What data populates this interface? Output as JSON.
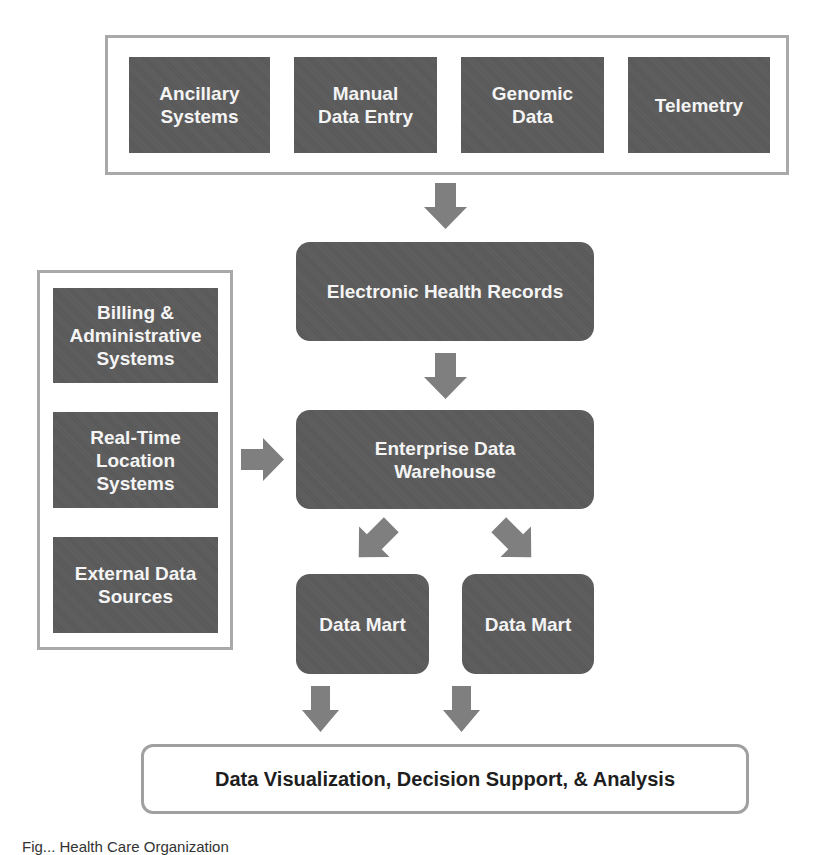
{
  "diagram": {
    "sources_top": [
      {
        "label": "Ancillary\nSystems"
      },
      {
        "label": "Manual\nData Entry"
      },
      {
        "label": "Genomic\nData"
      },
      {
        "label": "Telemetry"
      }
    ],
    "sources_left": [
      {
        "label": "Billing &\nAdministrative\nSystems"
      },
      {
        "label": "Real-Time\nLocation\nSystems"
      },
      {
        "label": "External Data\nSources"
      }
    ],
    "ehr": {
      "label": "Electronic Health Records"
    },
    "edw": {
      "label": "Enterprise Data\nWarehouse"
    },
    "data_marts": [
      {
        "label": "Data Mart"
      },
      {
        "label": "Data Mart"
      }
    ],
    "output": {
      "label": "Data Visualization, Decision Support, & Analysis"
    },
    "caption": "Fig... Health Care Organization"
  },
  "colors": {
    "box_fill": "#5b5b5b",
    "box_text": "#f4f4f4",
    "arrow": "#7f7f7f",
    "frame_border": "#a9a9a9"
  }
}
